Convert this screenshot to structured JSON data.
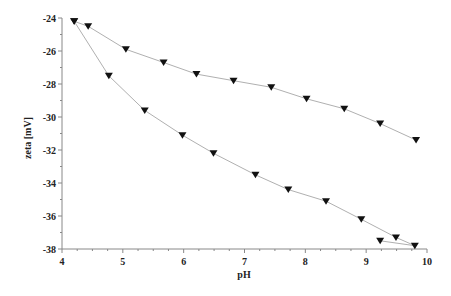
{
  "chart_data": {
    "type": "scatter",
    "title": "",
    "xlabel": "pH",
    "ylabel": "zeta [mV]",
    "xlim": [
      4,
      10
    ],
    "ylim": [
      -38,
      -24
    ],
    "x_ticks": [
      "4",
      "5",
      "6",
      "7",
      "8",
      "9",
      "10"
    ],
    "y_ticks": [
      "-24",
      "-26",
      "-28",
      "-30",
      "-32",
      "-34",
      "-36",
      "-38"
    ],
    "grid": false,
    "legend": null,
    "marker": "down-triangle",
    "series": [
      {
        "name": "upper curve",
        "x": [
          4.2,
          4.43,
          5.05,
          5.67,
          6.21,
          6.82,
          7.44,
          8.02,
          8.64,
          9.23,
          9.82
        ],
        "y": [
          -24.2,
          -24.5,
          -25.9,
          -26.7,
          -27.4,
          -27.8,
          -28.2,
          -28.9,
          -29.5,
          -30.4,
          -31.4
        ]
      },
      {
        "name": "lower curve",
        "x": [
          4.2,
          4.77,
          5.36,
          5.98,
          6.49,
          7.18,
          7.72,
          8.34,
          8.92,
          9.49,
          9.8,
          9.23
        ],
        "y": [
          -24.2,
          -27.5,
          -29.6,
          -31.1,
          -32.2,
          -33.5,
          -34.4,
          -35.1,
          -36.2,
          -37.3,
          -37.8,
          -37.5
        ]
      }
    ],
    "colors": {
      "line": "#b0b0b0",
      "marker": "#111111",
      "axis": "#888888"
    }
  }
}
